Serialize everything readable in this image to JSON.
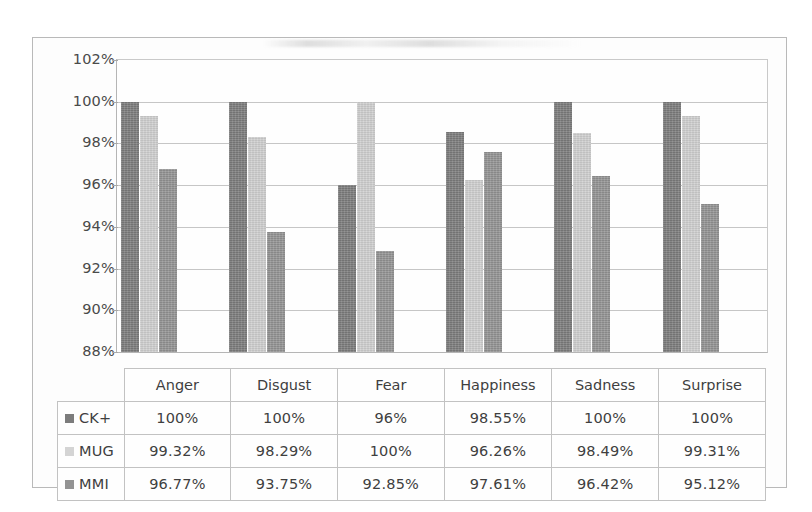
{
  "chart_data": {
    "type": "bar",
    "title": "",
    "xlabel": "",
    "ylabel": "",
    "ylim": [
      88,
      102
    ],
    "ytick_step": 2,
    "grid": true,
    "legend_position": "table-row-headers",
    "categories": [
      "Anger",
      "Disgust",
      "Fear",
      "Happiness",
      "Sadness",
      "Surprise"
    ],
    "ytick_labels": [
      "102%",
      "100%",
      "98%",
      "96%",
      "94%",
      "92%",
      "90%",
      "88%"
    ],
    "ytick_values": [
      102,
      100,
      98,
      96,
      94,
      92,
      90,
      88
    ],
    "series": [
      {
        "name": "CK+",
        "color": "#7c7c7c",
        "values": [
          100,
          100,
          96,
          98.55,
          100,
          100
        ],
        "labels": [
          "100%",
          "100%",
          "96%",
          "98.55%",
          "100%",
          "100%"
        ]
      },
      {
        "name": "MUG",
        "color": "#cfcfcf",
        "values": [
          99.32,
          98.29,
          100,
          96.26,
          98.49,
          99.31
        ],
        "labels": [
          "99.32%",
          "98.29%",
          "100%",
          "96.26%",
          "98.49%",
          "99.31%"
        ]
      },
      {
        "name": "MMI",
        "color": "#939393",
        "values": [
          96.77,
          93.75,
          92.85,
          97.61,
          96.42,
          95.12
        ],
        "labels": [
          "96.77%",
          "93.75%",
          "92.85%",
          "97.61%",
          "96.42%",
          "95.12%"
        ]
      }
    ]
  },
  "table": {
    "corner_label": "",
    "column_headers": [
      "Anger",
      "Disgust",
      "Fear",
      "Happiness",
      "Sadness",
      "Surprise"
    ],
    "rows": [
      {
        "series": "CK+",
        "swatch": "series-marker-ck-plus",
        "cells": [
          "100%",
          "100%",
          "96%",
          "98.55%",
          "100%",
          "100%"
        ]
      },
      {
        "series": "MUG",
        "swatch": "series-marker-mug",
        "cells": [
          "99.32%",
          "98.29%",
          "100%",
          "96.26%",
          "98.49%",
          "99.31%"
        ]
      },
      {
        "series": "MMI",
        "swatch": "series-marker-mmi",
        "cells": [
          "96.77%",
          "93.75%",
          "92.85%",
          "97.61%",
          "96.42%",
          "95.12%"
        ]
      }
    ]
  },
  "colors": {
    "series_ck_plus": "#7c7c7c",
    "series_mug": "#cfcfcf",
    "series_mmi": "#939393",
    "gridline": "#c6c6c6",
    "frame_border": "#b9b9b9",
    "table_border": "#c2c2c2",
    "background": "#fdfdfd",
    "text": "#3f3f3f"
  }
}
